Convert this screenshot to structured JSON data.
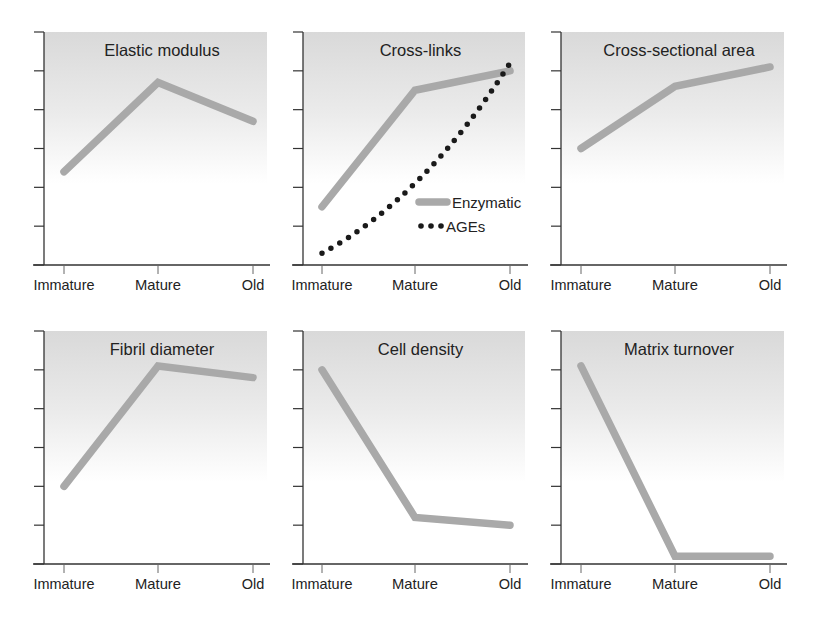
{
  "colors": {
    "line": "#a9a9a9",
    "dots": "#1a1a1a",
    "axis": "#333333",
    "text": "#222222",
    "panel_top": "#d9d9d9",
    "panel_bottom": "#ffffff"
  },
  "x_categories": [
    "Immature",
    "Mature",
    "Old"
  ],
  "legend": {
    "items": [
      {
        "label": "Enzymatic",
        "style": "solid"
      },
      {
        "label": "AGEs",
        "style": "dotted"
      }
    ]
  },
  "panels": [
    {
      "title": "Elastic modulus"
    },
    {
      "title": "Cross-links"
    },
    {
      "title": "Cross-sectional area"
    },
    {
      "title": "Fibril diameter"
    },
    {
      "title": "Cell density"
    },
    {
      "title": "Matrix turnover"
    }
  ],
  "chart_data": [
    {
      "type": "line",
      "title": "Elastic modulus",
      "categories": [
        "Immature",
        "Mature",
        "Old"
      ],
      "series": [
        {
          "name": "Elastic modulus",
          "values": [
            2.4,
            4.7,
            3.7
          ]
        }
      ],
      "xlabel": "",
      "ylabel": "",
      "ylim": [
        0,
        6
      ],
      "y_ticks_count": 6,
      "grid": false,
      "y_tick_labels": false
    },
    {
      "type": "line",
      "title": "Cross-links",
      "categories": [
        "Immature",
        "Mature",
        "Old"
      ],
      "series": [
        {
          "name": "Enzymatic",
          "style": "solid",
          "values": [
            1.5,
            4.5,
            5.0
          ]
        },
        {
          "name": "AGEs",
          "style": "dotted",
          "values": [
            0.3,
            2.1,
            5.2
          ]
        }
      ],
      "legend": {
        "entries": [
          "Enzymatic",
          "AGEs"
        ],
        "position": "lower right"
      },
      "xlabel": "",
      "ylabel": "",
      "ylim": [
        0,
        6
      ],
      "y_ticks_count": 6,
      "grid": false,
      "y_tick_labels": false
    },
    {
      "type": "line",
      "title": "Cross-sectional area",
      "categories": [
        "Immature",
        "Mature",
        "Old"
      ],
      "series": [
        {
          "name": "Cross-sectional area",
          "values": [
            3.0,
            4.6,
            5.1
          ]
        }
      ],
      "xlabel": "",
      "ylabel": "",
      "ylim": [
        0,
        6
      ],
      "y_ticks_count": 6,
      "grid": false,
      "y_tick_labels": false
    },
    {
      "type": "line",
      "title": "Fibril diameter",
      "categories": [
        "Immature",
        "Mature",
        "Old"
      ],
      "series": [
        {
          "name": "Fibril diameter",
          "values": [
            2.0,
            5.1,
            4.8
          ]
        }
      ],
      "xlabel": "",
      "ylabel": "",
      "ylim": [
        0,
        6
      ],
      "y_ticks_count": 6,
      "grid": false,
      "y_tick_labels": false
    },
    {
      "type": "line",
      "title": "Cell density",
      "categories": [
        "Immature",
        "Mature",
        "Old"
      ],
      "series": [
        {
          "name": "Cell density",
          "values": [
            5.0,
            1.2,
            1.0
          ]
        }
      ],
      "xlabel": "",
      "ylabel": "",
      "ylim": [
        0,
        6
      ],
      "y_ticks_count": 6,
      "grid": false,
      "y_tick_labels": false
    },
    {
      "type": "line",
      "title": "Matrix turnover",
      "categories": [
        "Immature",
        "Mature",
        "Old"
      ],
      "series": [
        {
          "name": "Matrix turnover",
          "values": [
            5.1,
            0.2,
            0.2
          ]
        }
      ],
      "xlabel": "",
      "ylabel": "",
      "ylim": [
        0,
        6
      ],
      "y_ticks_count": 6,
      "grid": false,
      "y_tick_labels": false
    }
  ]
}
